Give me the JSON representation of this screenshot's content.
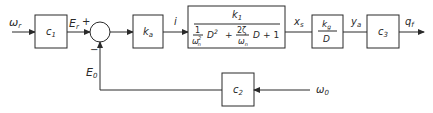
{
  "diagram": {
    "type": "control-system-block-diagram",
    "signals": {
      "input": "ω",
      "input_sub": "r",
      "error_ref": "E",
      "error_ref_sub": "r",
      "plus_sign": "+",
      "minus_sign": "−",
      "feedback": "E",
      "feedback_sub": "0",
      "current": "i",
      "displacement": "x",
      "displacement_sub": "s",
      "angle": "y",
      "angle_sub": "a",
      "output": "q",
      "output_sub": "f",
      "disturbance": "ω",
      "disturbance_sub": "0"
    },
    "blocks": {
      "c1": {
        "main": "c",
        "sub": "1"
      },
      "ka": {
        "main": "k",
        "sub": "a"
      },
      "plant": {
        "num_main": "k",
        "num_sub": "1",
        "den_one": "1",
        "den_omega": "ω",
        "den_omega_sub": "n",
        "den_omega_sup": "2",
        "den_d2": "D",
        "den_d2_sup": "2",
        "den_plus1": "+",
        "den_two_zeta": "2ζ",
        "den_omega2": "ω",
        "den_omega2_sub": "n",
        "den_d": "D",
        "den_plus2": "+ 1"
      },
      "integrator": {
        "num_main": "k",
        "num_sub": "g",
        "den": "D"
      },
      "c3": {
        "main": "c",
        "sub": "3"
      },
      "c2": {
        "main": "c",
        "sub": "2"
      }
    }
  }
}
